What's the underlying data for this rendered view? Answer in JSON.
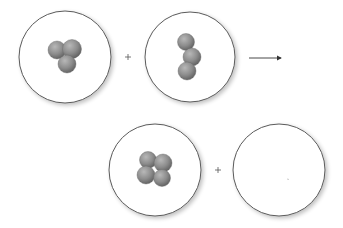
{
  "diagram": {
    "colors": {
      "background": "#ffffff",
      "circle_stroke": "#5a5a5a",
      "circle_shadow": "#cfcfcf",
      "sphere_light": "#b3b3b3",
      "sphere_mid": "#8a8a8a",
      "sphere_dark": "#5e5e5e",
      "operator": "#555555",
      "arrow": "#333333"
    },
    "reactants": [
      {
        "id": "reactant-1",
        "center": [
          65,
          57
        ],
        "radius": 46,
        "spheres": [
          {
            "x": 57,
            "y": 50,
            "r": 9
          },
          {
            "x": 72,
            "y": 49,
            "r": 9.5
          },
          {
            "x": 67,
            "y": 64,
            "r": 9
          }
        ]
      },
      {
        "id": "reactant-2",
        "center": [
          190,
          57
        ],
        "radius": 45,
        "spheres": [
          {
            "x": 186,
            "y": 42,
            "r": 8.5
          },
          {
            "x": 192,
            "y": 57,
            "r": 9
          },
          {
            "x": 187,
            "y": 71,
            "r": 9
          }
        ]
      }
    ],
    "products": [
      {
        "id": "product-1",
        "center": [
          155,
          170
        ],
        "radius": 46,
        "spheres": [
          {
            "x": 148,
            "y": 160,
            "r": 8.5
          },
          {
            "x": 163,
            "y": 163,
            "r": 9
          },
          {
            "x": 146,
            "y": 175,
            "r": 9
          },
          {
            "x": 162,
            "y": 178,
            "r": 8.5
          }
        ]
      },
      {
        "id": "product-2",
        "center": [
          279,
          170
        ],
        "radius": 46,
        "spheres": []
      }
    ],
    "operators": [
      {
        "type": "plus",
        "symbol": "+",
        "x": 128,
        "y": 57
      },
      {
        "type": "plus",
        "symbol": "+",
        "x": 218,
        "y": 170
      }
    ],
    "arrow": {
      "x1": 249,
      "y1": 58,
      "x2": 284,
      "y2": 58,
      "label": "yields"
    }
  }
}
